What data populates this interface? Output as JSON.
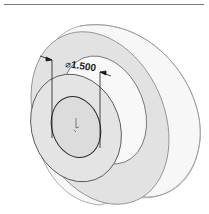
{
  "figure": {
    "type": "3D CAD model view of a stepped cylindrical part with a counterbore",
    "dimension": {
      "symbol": "⌀",
      "value": "1.500"
    },
    "colors": {
      "face_fill": "#e2e2e2",
      "side_fill": "#f7f7f7",
      "edge": "#4a4a4a",
      "silhouette": "#8a8a8a",
      "dimension": "#1a1a1a"
    }
  }
}
